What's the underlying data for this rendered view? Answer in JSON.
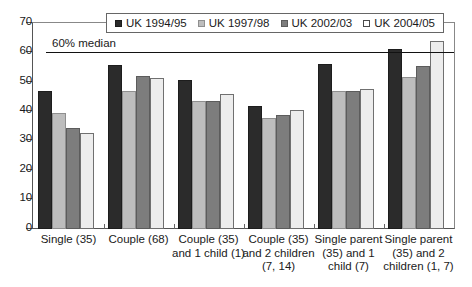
{
  "chart_data": {
    "type": "bar",
    "title": "",
    "subtitle": "",
    "xlabel": "",
    "ylabel": "",
    "ylim": [
      0,
      70
    ],
    "yticks": [
      0,
      10,
      20,
      30,
      40,
      50,
      60,
      70
    ],
    "ytick_labels": [
      "0",
      "10",
      "20",
      "30",
      "40",
      "50",
      "60",
      "70"
    ],
    "grid": false,
    "legend_position": "top-center",
    "categories": [
      "Single (35)",
      "Couple (68)",
      "Couple (35) and 1 child (1)",
      "Couple (35) and 2 children (7, 14)",
      "Single parent (35) and 1 child (7)",
      "Single parent (35) and 2 children (1, 7)"
    ],
    "category_lines": [
      [
        "Single (35)"
      ],
      [
        "Couple (68)"
      ],
      [
        "Couple (35)",
        "and 1 child (1)"
      ],
      [
        "Couple (35)",
        "and 2 children",
        "(7, 14)"
      ],
      [
        "Single parent",
        "(35) and 1",
        "child (7)"
      ],
      [
        "Single parent",
        "(35) and 2",
        "children (1, 7)"
      ]
    ],
    "series": [
      {
        "name": "UK 1994/95",
        "color": "#2b2b2b",
        "values": [
          46.8,
          55.7,
          50.7,
          41.6,
          56.0,
          61.2
        ]
      },
      {
        "name": "UK 1997/98",
        "color": "#bdbdbd",
        "values": [
          39.5,
          47.0,
          43.5,
          37.8,
          46.7,
          51.6
        ]
      },
      {
        "name": "UK 2002/03",
        "color": "#7d7d7d",
        "values": [
          34.2,
          52.1,
          43.4,
          38.6,
          46.8,
          55.4
        ]
      },
      {
        "name": "UK 2004/05",
        "color": "#ededed",
        "values": [
          32.5,
          51.4,
          45.7,
          40.2,
          47.6,
          64.0
        ]
      }
    ],
    "annotations": [
      {
        "name": "median-line",
        "label": "60% median",
        "value": 60
      }
    ]
  },
  "legend": {
    "items": [
      {
        "label": "UK 1994/95",
        "swatch": "series-0-swatch"
      },
      {
        "label": "UK 1997/98",
        "swatch": "series-1-swatch"
      },
      {
        "label": "UK 2002/03",
        "swatch": "series-2-swatch"
      },
      {
        "label": "UK 2004/05",
        "swatch": "series-3-swatch"
      }
    ]
  }
}
